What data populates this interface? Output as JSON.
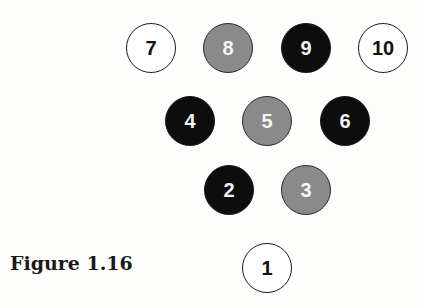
{
  "figure": {
    "caption": "Figure 1.16",
    "colors": {
      "white": "#ffffff",
      "gray": "#8a8a8a",
      "black": "#0d0d0d"
    },
    "pins": [
      {
        "label": "7",
        "shade": "white",
        "cx": 151,
        "cy": 48
      },
      {
        "label": "8",
        "shade": "gray",
        "cx": 228,
        "cy": 48
      },
      {
        "label": "9",
        "shade": "black",
        "cx": 306,
        "cy": 48
      },
      {
        "label": "10",
        "shade": "white",
        "cx": 383,
        "cy": 48
      },
      {
        "label": "4",
        "shade": "black",
        "cx": 190,
        "cy": 121
      },
      {
        "label": "5",
        "shade": "gray",
        "cx": 267,
        "cy": 121
      },
      {
        "label": "6",
        "shade": "black",
        "cx": 345,
        "cy": 121
      },
      {
        "label": "2",
        "shade": "black",
        "cx": 229,
        "cy": 190
      },
      {
        "label": "3",
        "shade": "gray",
        "cx": 306,
        "cy": 190
      },
      {
        "label": "1",
        "shade": "white",
        "cx": 267,
        "cy": 268
      }
    ]
  }
}
